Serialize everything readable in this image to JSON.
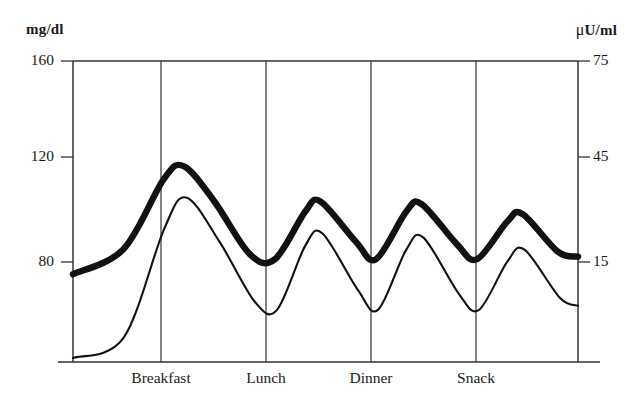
{
  "chart_data": {
    "type": "line",
    "title": "",
    "subtitle": "",
    "xlabel": "",
    "ylabel": "mg/dl",
    "y2label": "μU/ml",
    "grid": "vertical-only",
    "legend_position": "none",
    "x": [
      0,
      0.5,
      1,
      1.5,
      2,
      2.5,
      3,
      3.5,
      4,
      4.5,
      5
    ],
    "x_tick_positions": [
      1,
      2,
      3,
      4
    ],
    "x_tick_labels": [
      "Breakfast",
      "Lunch",
      "Dinner",
      "Snack"
    ],
    "ylim": [
      40,
      160
    ],
    "y_ticks": [
      80,
      120,
      160
    ],
    "y_tick_labels": [
      "80",
      "120",
      "160"
    ],
    "y2lim": [
      0,
      75
    ],
    "y2_ticks": [
      15,
      45,
      75
    ],
    "y2_tick_labels": [
      "15",
      "45",
      "75"
    ],
    "series": [
      {
        "name": "Glucose",
        "unit": "mg/dl",
        "axis": "left",
        "line_weight": "thick",
        "color": "#111111",
        "points": [
          {
            "x": 0.0,
            "y": 75
          },
          {
            "x": 0.5,
            "y": 85
          },
          {
            "x": 0.9,
            "y": 113
          },
          {
            "x": 1.1,
            "y": 118
          },
          {
            "x": 1.4,
            "y": 104
          },
          {
            "x": 1.75,
            "y": 83
          },
          {
            "x": 2.0,
            "y": 81
          },
          {
            "x": 2.3,
            "y": 100
          },
          {
            "x": 2.45,
            "y": 104
          },
          {
            "x": 2.8,
            "y": 88
          },
          {
            "x": 3.0,
            "y": 81
          },
          {
            "x": 3.3,
            "y": 100
          },
          {
            "x": 3.45,
            "y": 103
          },
          {
            "x": 3.8,
            "y": 87
          },
          {
            "x": 4.0,
            "y": 81
          },
          {
            "x": 4.3,
            "y": 96
          },
          {
            "x": 4.45,
            "y": 99
          },
          {
            "x": 4.8,
            "y": 84
          },
          {
            "x": 5.0,
            "y": 82
          }
        ]
      },
      {
        "name": "Insulin",
        "unit": "μU/ml",
        "axis": "right",
        "line_weight": "thin",
        "color": "#111111",
        "points": [
          {
            "x": 0.0,
            "y": 1
          },
          {
            "x": 0.5,
            "y": 6
          },
          {
            "x": 0.9,
            "y": 33
          },
          {
            "x": 1.12,
            "y": 41
          },
          {
            "x": 1.45,
            "y": 30
          },
          {
            "x": 1.8,
            "y": 15
          },
          {
            "x": 2.02,
            "y": 13
          },
          {
            "x": 2.3,
            "y": 29
          },
          {
            "x": 2.47,
            "y": 32
          },
          {
            "x": 2.82,
            "y": 18
          },
          {
            "x": 3.02,
            "y": 13
          },
          {
            "x": 3.3,
            "y": 28
          },
          {
            "x": 3.47,
            "y": 31
          },
          {
            "x": 3.82,
            "y": 17
          },
          {
            "x": 4.02,
            "y": 13
          },
          {
            "x": 4.3,
            "y": 25
          },
          {
            "x": 4.47,
            "y": 28
          },
          {
            "x": 4.82,
            "y": 16
          },
          {
            "x": 5.0,
            "y": 14
          }
        ]
      }
    ]
  },
  "axes": {
    "left_unit": "mg/dl",
    "right_unit_mu": "μ",
    "right_unit_rest": "U/ml",
    "left_ticks": [
      {
        "label": "160",
        "value": 160
      },
      {
        "label": "120",
        "value": 120
      },
      {
        "label": "80",
        "value": 80
      }
    ],
    "right_ticks": [
      {
        "label": "75",
        "value": 75
      },
      {
        "label": "45",
        "value": 45
      },
      {
        "label": "15",
        "value": 15
      }
    ],
    "x_ticks": [
      {
        "label": "Breakfast"
      },
      {
        "label": "Lunch"
      },
      {
        "label": "Dinner"
      },
      {
        "label": "Snack"
      }
    ]
  }
}
